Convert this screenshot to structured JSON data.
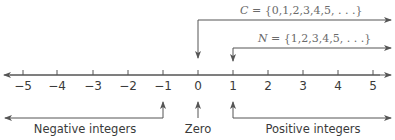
{
  "diagram": {
    "type": "number-line",
    "colors": {
      "line": "#555555",
      "text": "#3a3a3a",
      "set_text": "#6a6a6a"
    },
    "ticks": [
      {
        "value": "−5",
        "x": 23
      },
      {
        "value": "−4",
        "x": 57
      },
      {
        "value": "−3",
        "x": 93
      },
      {
        "value": "−2",
        "x": 128
      },
      {
        "value": "−1",
        "x": 163
      },
      {
        "value": "0",
        "x": 198
      },
      {
        "value": "1",
        "x": 233
      },
      {
        "value": "2",
        "x": 268
      },
      {
        "value": "3",
        "x": 303
      },
      {
        "value": "4",
        "x": 338
      },
      {
        "value": "5",
        "x": 373
      }
    ],
    "sets": {
      "C": {
        "name": "C",
        "definition": " = {0,1,2,3,4,5, . . .}"
      },
      "N": {
        "name": "N",
        "definition": " = {1,2,3,4,5, . . .}"
      }
    },
    "categories": {
      "negative": "Negative integers",
      "zero": "Zero",
      "positive": "Positive integers"
    }
  }
}
